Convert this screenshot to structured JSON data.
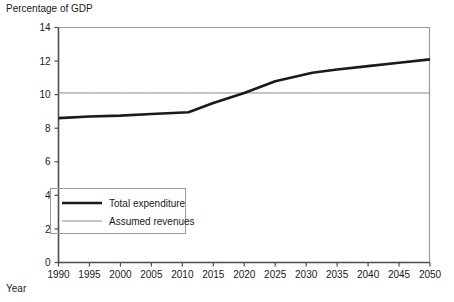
{
  "chart_data": {
    "type": "line",
    "title": "",
    "ylabel": "Percentage of GDP",
    "xlabel": "Year",
    "xlim": [
      1990,
      2050
    ],
    "ylim": [
      0,
      14
    ],
    "ytick_step": 2,
    "xtick_step": 5,
    "grid": false,
    "legend_position": "lower-left-inside",
    "xticks": [
      1990,
      1995,
      2000,
      2005,
      2010,
      2015,
      2020,
      2025,
      2030,
      2035,
      2040,
      2045,
      2050
    ],
    "yticks": [
      0,
      2,
      4,
      6,
      8,
      10,
      12,
      14
    ],
    "x": [
      1990,
      1995,
      2000,
      2005,
      2011,
      2015,
      2020,
      2025,
      2031,
      2035,
      2040,
      2045,
      2050
    ],
    "series": [
      {
        "name": "Total expenditure",
        "color": "#1a1a1a",
        "width": 2.6,
        "values": [
          8.6,
          8.7,
          8.75,
          8.85,
          8.95,
          9.5,
          10.1,
          10.8,
          11.3,
          11.5,
          11.7,
          11.9,
          12.1
        ]
      },
      {
        "name": "Assumed revenues",
        "color": "#8c8c8c",
        "width": 1,
        "values": [
          10.1,
          10.1,
          10.1,
          10.1,
          10.1,
          10.1,
          10.1,
          10.1,
          10.1,
          10.1,
          10.1,
          10.1,
          10.1
        ]
      }
    ]
  },
  "legend": {
    "entries": [
      {
        "label": "Total expenditure"
      },
      {
        "label": "Assumed revenues"
      }
    ]
  },
  "axis_labels": {
    "y_title": "Percentage of GDP",
    "x_title": "Year"
  }
}
